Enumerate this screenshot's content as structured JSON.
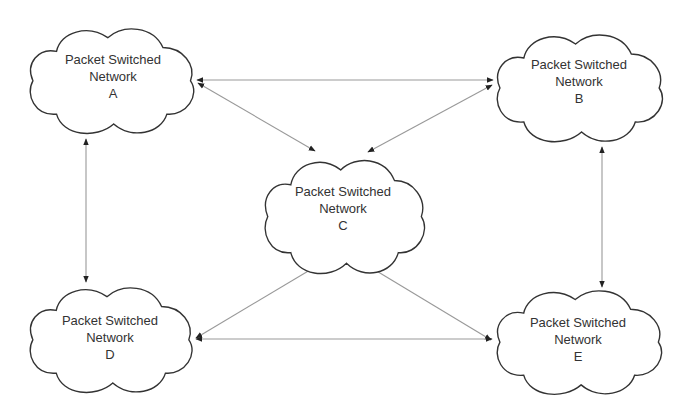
{
  "diagram": {
    "type": "network-topology",
    "colors": {
      "background": "#ffffff",
      "cloud_stroke": "#333333",
      "line": "#999999",
      "arrowhead": "#222222",
      "text": "#333333"
    },
    "nodes": [
      {
        "id": "A",
        "line1": "Packet Switched",
        "line2": "Network",
        "line3": "A"
      },
      {
        "id": "B",
        "line1": "Packet Switched",
        "line2": "Network",
        "line3": "B"
      },
      {
        "id": "C",
        "line1": "Packet Switched",
        "line2": "Network",
        "line3": "C"
      },
      {
        "id": "D",
        "line1": "Packet Switched",
        "line2": "Network",
        "line3": "D"
      },
      {
        "id": "E",
        "line1": "Packet Switched",
        "line2": "Network",
        "line3": "E"
      }
    ],
    "edges": [
      {
        "from": "A",
        "to": "B",
        "direction": "bidirectional"
      },
      {
        "from": "A",
        "to": "C",
        "direction": "bidirectional"
      },
      {
        "from": "B",
        "to": "C",
        "direction": "bidirectional"
      },
      {
        "from": "A",
        "to": "D",
        "direction": "bidirectional"
      },
      {
        "from": "B",
        "to": "E",
        "direction": "bidirectional"
      },
      {
        "from": "D",
        "to": "C",
        "direction": "bidirectional"
      },
      {
        "from": "E",
        "to": "C",
        "direction": "bidirectional"
      },
      {
        "from": "D",
        "to": "E",
        "direction": "bidirectional"
      }
    ]
  }
}
